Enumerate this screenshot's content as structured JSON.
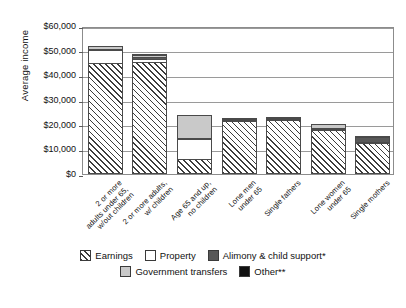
{
  "chart_data": {
    "type": "bar",
    "title": "",
    "subtitle": "",
    "xlabel": "",
    "ylabel": "Average income",
    "ylim": [
      0,
      60000
    ],
    "ytick_values": [
      0,
      10000,
      20000,
      30000,
      40000,
      50000,
      60000
    ],
    "ytick_labels": [
      "$0",
      "$10,000",
      "$20,000",
      "$30,000",
      "$40,000",
      "$50,000",
      "$60,000"
    ],
    "grid": true,
    "stacked": true,
    "legend_position": "bottom",
    "categories": [
      "2 or more adults under 65, w/out children",
      "2 or more adults, w/ children",
      "Age 65 and up, no children",
      "Lone men under 65",
      "Single fathers",
      "Lone women under 65",
      "Single mothers"
    ],
    "category_lines": [
      [
        "2 or more",
        "adults under 65,",
        "w/out children"
      ],
      [
        "2 or more adults,",
        "w/ children"
      ],
      [
        "Age 65 and up,",
        "no children"
      ],
      [
        "Lone men",
        "under 65"
      ],
      [
        "Single fathers"
      ],
      [
        "Lone women",
        "under 65"
      ],
      [
        "Single mothers"
      ]
    ],
    "series": [
      {
        "name": "Earnings",
        "key": "earnings",
        "values": [
          45200,
          45500,
          6000,
          21500,
          21800,
          17800,
          12500
        ]
      },
      {
        "name": "Property",
        "key": "property",
        "values": [
          5400,
          1700,
          8500,
          900,
          700,
          900,
          500
        ]
      },
      {
        "name": "Alimony & child support*",
        "key": "alimony",
        "values": [
          300,
          900,
          200,
          400,
          400,
          300,
          2400
        ]
      },
      {
        "name": "Government transfers",
        "key": "govt",
        "values": [
          1800,
          1200,
          9800,
          600,
          700,
          2000,
          600
        ]
      },
      {
        "name": "Other**",
        "key": "other",
        "values": [
          0,
          200,
          0,
          0,
          0,
          0,
          0
        ]
      }
    ],
    "totals": [
      52700,
      49500,
      24500,
      23400,
      23600,
      21000,
      16000
    ]
  },
  "legend": {
    "rows": [
      [
        {
          "label": "Earnings",
          "key": "earnings"
        },
        {
          "label": "Property",
          "key": "property"
        },
        {
          "label": "Alimony & child support*",
          "key": "alimony"
        }
      ],
      [
        {
          "label": "Government transfers",
          "key": "govt"
        },
        {
          "label": "Other**",
          "key": "other"
        }
      ]
    ]
  },
  "colors": {
    "earnings": "#ffffff",
    "property": "#ffffff",
    "alimony": "#585858",
    "govt": "#c9c9c9",
    "other": "#111111",
    "axis": "#8c8c8c",
    "grid": "#9a9a9a",
    "text": "#111111"
  }
}
